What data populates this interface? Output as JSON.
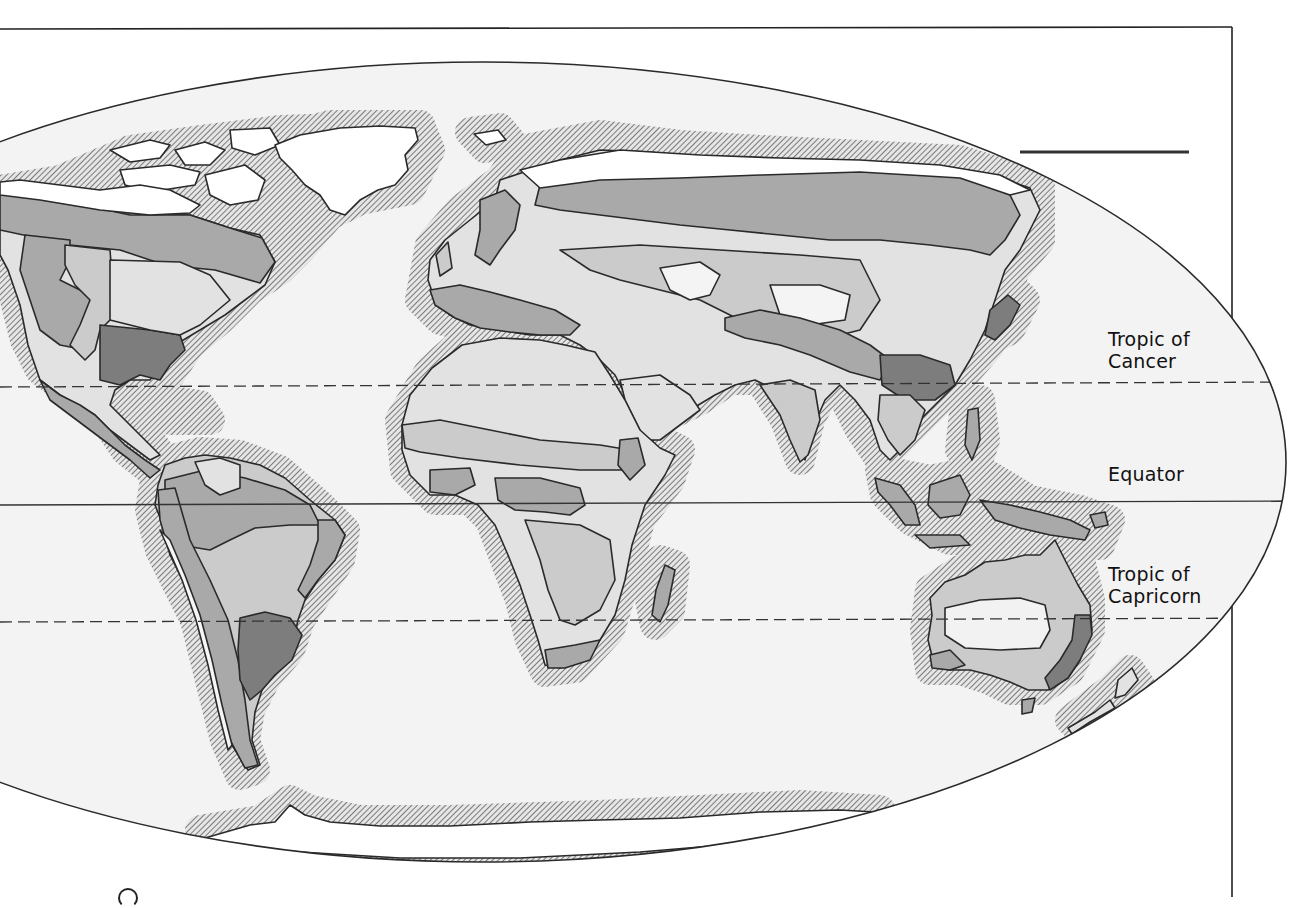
{
  "figure": {
    "type": "world map",
    "projection": "elliptical (Mollweide-like)",
    "style": "grayscale shaded regions with hatched coastal halos"
  },
  "latitude_lines": [
    {
      "id": "tropic-of-cancer",
      "label_line1": "Tropic of",
      "label_line2": "Cancer",
      "style": "dashed"
    },
    {
      "id": "equator",
      "label_line1": "Equator",
      "label_line2": "",
      "style": "solid"
    },
    {
      "id": "tropic-of-capricorn",
      "label_line1": "Tropic of",
      "label_line2": "Capricorn",
      "style": "dashed"
    }
  ],
  "colors": {
    "ocean": "#f3f3f3",
    "ice": "#ffffff",
    "zone_very_light": "#e2e2e2",
    "zone_light": "#cbcbcb",
    "zone_medium": "#a9a9a9",
    "zone_dark": "#7d7d7d",
    "coast_halo": "#8c8c8c",
    "outline": "#2a2a2a"
  }
}
